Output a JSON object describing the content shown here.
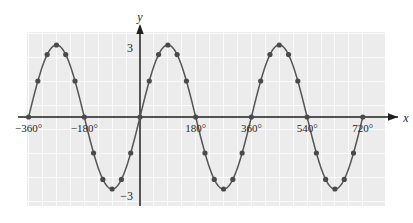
{
  "chart_data": {
    "type": "line",
    "title": "",
    "subtitle": "",
    "xlabel": "x",
    "ylabel": "y",
    "function": "y = 3 sin x",
    "amplitude": 3,
    "period_degrees": 360,
    "grid": true,
    "grid_step_x_degrees": 45,
    "grid_step_y": 1,
    "legend": "none",
    "xlim": [
      -390,
      745
    ],
    "ylim": [
      -3.6,
      3.6
    ],
    "x_tick_labels": [
      "−360°",
      "−180°",
      "180°",
      "360°",
      "540°",
      "720°"
    ],
    "x_tick_values": [
      -360,
      -180,
      180,
      360,
      540,
      720
    ],
    "y_tick_labels": [
      "3",
      "−3"
    ],
    "y_tick_values": [
      3,
      -3
    ],
    "marker_step_degrees": 30,
    "x": [
      -360,
      -330,
      -300,
      -270,
      -240,
      -210,
      -180,
      -150,
      -120,
      -90,
      -60,
      -30,
      0,
      30,
      60,
      90,
      120,
      150,
      180,
      210,
      240,
      270,
      300,
      330,
      360,
      390,
      420,
      450,
      480,
      510,
      540,
      570,
      600,
      630,
      660,
      690,
      720
    ],
    "values": [
      0,
      1.5,
      2.6,
      3,
      2.6,
      1.5,
      0,
      -1.5,
      -2.6,
      -3,
      -2.6,
      -1.5,
      0,
      1.5,
      2.6,
      3,
      2.6,
      1.5,
      0,
      -1.5,
      -2.6,
      -3,
      -2.6,
      -1.5,
      0,
      1.5,
      2.6,
      3,
      2.6,
      1.5,
      0,
      -1.5,
      -2.6,
      -3,
      -2.6,
      -1.5,
      0
    ],
    "colors": {
      "curve": "#555555",
      "marker": "#4a4a4a",
      "axis": "#1f1f1f",
      "plot_background": "#ececec",
      "gridline": "#ffffff",
      "page_background": "#ffffff"
    }
  },
  "axes": {
    "y_axis_label": "y",
    "x_axis_label": "x",
    "y_top_tick_label": "3",
    "y_bottom_tick_label": "−3"
  }
}
